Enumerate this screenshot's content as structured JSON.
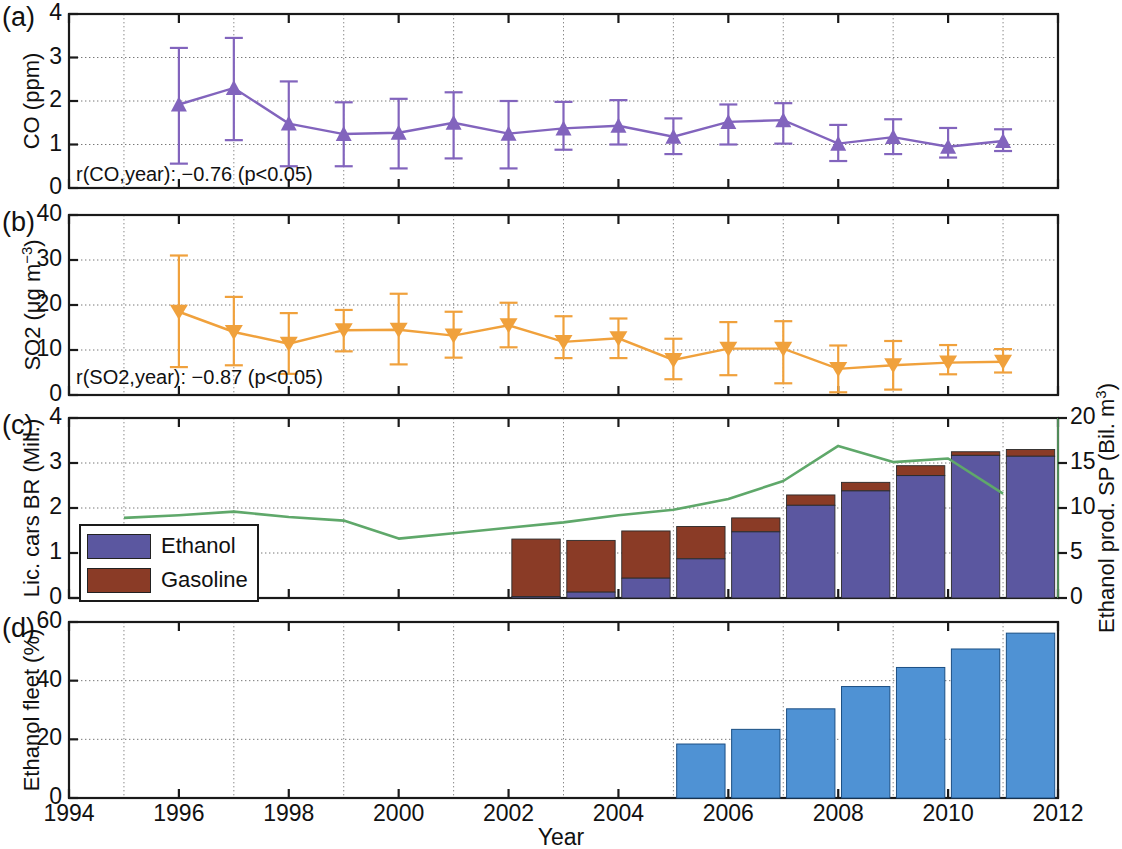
{
  "figure": {
    "xlabel": "Year",
    "x_ticks": [
      "1994",
      "1996",
      "1998",
      "2000",
      "2002",
      "2004",
      "2006",
      "2008",
      "2010",
      "2012"
    ],
    "xlim": [
      1994,
      2012
    ],
    "panels": [
      "(a)",
      "(b)",
      "(c)",
      "(d)"
    ]
  },
  "panel_a": {
    "letter": "(a)",
    "ylabel": "CO (ppm)",
    "y_ticks": [
      "0",
      "1",
      "2",
      "3",
      "4"
    ],
    "annotation": "r(CO,year): −0.76 (p<0.05)",
    "color": "#8264bd"
  },
  "panel_b": {
    "letter": "(b)",
    "ylabel_main": "SO2 (μg m",
    "ylabel_sup": "−3",
    "ylabel_tail": ")",
    "y_ticks": [
      "0",
      "10",
      "20",
      "30",
      "40"
    ],
    "annotation": "r(SO2,year): −0.87 (p<0.05)",
    "color": "#f0a13c"
  },
  "panel_c": {
    "letter": "(c)",
    "ylabel": "Lic. cars BR (Mill.)",
    "y_ticks": [
      "0",
      "1",
      "2",
      "3",
      "4"
    ],
    "ylabel_right_main": "Ethanol prod. SP (Bil. m",
    "ylabel_right_sup": "3",
    "ylabel_right_tail": ")",
    "y_ticks_right": [
      "0",
      "5",
      "10",
      "15",
      "20"
    ],
    "legend": [
      {
        "label": "Ethanol",
        "color": "#5b57a0"
      },
      {
        "label": "Gasoline",
        "color": "#8a3b26"
      }
    ],
    "line_color": "#5fa86a"
  },
  "panel_d": {
    "letter": "(d)",
    "ylabel": "Ethanol fleet (%)",
    "y_ticks": [
      "0",
      "20",
      "40",
      "60"
    ],
    "color": "#4f92d4"
  },
  "chart_data": [
    {
      "type": "line",
      "panel": "(a)",
      "title": "",
      "ylabel": "CO (ppm)",
      "xlabel": "Year",
      "ylim": [
        0,
        4
      ],
      "xlim": [
        1994,
        2012
      ],
      "grid": true,
      "annotation": "r(CO,year): −0.76 (p<0.05)",
      "marker": "triangle-up",
      "color": "#8264bd",
      "x": [
        1996,
        1997,
        1998,
        1999,
        2000,
        2001,
        2002,
        2003,
        2004,
        2005,
        2006,
        2007,
        2008,
        2009,
        2010,
        2011
      ],
      "values": [
        1.92,
        2.3,
        1.48,
        1.24,
        1.27,
        1.37,
        1.5,
        1.25,
        1.37,
        1.43,
        1.18,
        1.52,
        1.56,
        1.02,
        1.17,
        1.16,
        0.95,
        1.08
      ],
      "series": [
        {
          "name": "CO",
          "x": [
            1996,
            1997,
            1998,
            1999,
            2000,
            2001,
            2002,
            2003,
            2004,
            2005,
            2006,
            2007,
            2008,
            2009,
            2010,
            2011
          ],
          "values": [
            1.92,
            2.3,
            1.48,
            1.24,
            1.27,
            1.5,
            1.25,
            1.37,
            1.43,
            1.18,
            1.52,
            1.56,
            1.02,
            1.17,
            0.95,
            1.08
          ],
          "err_low": [
            0.56,
            1.1,
            0.5,
            0.5,
            0.45,
            0.68,
            0.45,
            0.88,
            1.0,
            0.78,
            1.0,
            1.02,
            0.62,
            0.78,
            0.7,
            0.85
          ],
          "err_high": [
            3.22,
            3.45,
            2.45,
            1.97,
            2.05,
            2.2,
            2.0,
            1.98,
            2.02,
            1.6,
            1.92,
            1.95,
            1.45,
            1.58,
            1.38,
            1.35
          ]
        }
      ]
    },
    {
      "type": "line",
      "panel": "(b)",
      "title": "",
      "ylabel": "SO2 (μg m−3)",
      "xlabel": "Year",
      "ylim": [
        0,
        40
      ],
      "xlim": [
        1994,
        2012
      ],
      "grid": true,
      "annotation": "r(SO2,year): −0.87 (p<0.05)",
      "marker": "triangle-down",
      "color": "#f0a13c",
      "series": [
        {
          "name": "SO2",
          "x": [
            1996,
            1997,
            1998,
            1999,
            2000,
            2001,
            2002,
            2003,
            2004,
            2005,
            2006,
            2007,
            2008,
            2009,
            2010,
            2011
          ],
          "values": [
            18.5,
            14.0,
            11.4,
            14.4,
            14.5,
            13.2,
            15.5,
            11.8,
            12.6,
            7.8,
            10.3,
            10.3,
            5.8,
            6.6,
            7.2,
            7.4
          ],
          "err_low": [
            6.2,
            6.6,
            4.7,
            9.7,
            6.8,
            8.3,
            10.6,
            8.2,
            8.2,
            3.5,
            4.4,
            2.6,
            0.6,
            1.2,
            4.6,
            5.0
          ],
          "err_high": [
            31.0,
            21.8,
            18.2,
            18.9,
            22.5,
            18.5,
            20.5,
            17.5,
            17.0,
            12.5,
            16.2,
            16.4,
            11.0,
            12.0,
            11.1,
            10.2
          ]
        }
      ]
    },
    {
      "type": "bar",
      "panel": "(c)",
      "title": "",
      "ylabel": "Lic. cars BR (Mill.)",
      "ylabel_right": "Ethanol prod. SP (Bil. m3)",
      "xlabel": "Year",
      "ylim": [
        0,
        4
      ],
      "ylim_right": [
        0,
        20
      ],
      "xlim": [
        1994,
        2012
      ],
      "grid": true,
      "stacked": true,
      "categories": [
        2002,
        2003,
        2004,
        2005,
        2006,
        2007,
        2008,
        2009,
        2010,
        2011
      ],
      "series": [
        {
          "name": "Ethanol",
          "color": "#5b57a0",
          "values": [
            0.03,
            0.13,
            0.44,
            0.87,
            1.47,
            2.06,
            2.38,
            2.72,
            3.17,
            3.15
          ]
        },
        {
          "name": "Gasoline",
          "color": "#8a3b26",
          "values": [
            1.28,
            1.15,
            1.05,
            0.72,
            0.31,
            0.23,
            0.19,
            0.22,
            0.08,
            0.15
          ]
        }
      ],
      "line_series": {
        "name": "Ethanol prod. SP",
        "color": "#5fa86a",
        "axis": "right",
        "x": [
          1995,
          1996,
          1997,
          1998,
          1999,
          2000,
          2001,
          2002,
          2003,
          2004,
          2005,
          2006,
          2007,
          2008,
          2009,
          2010,
          2011
        ],
        "values": [
          8.9,
          9.2,
          9.6,
          9.0,
          8.6,
          6.6,
          7.2,
          7.8,
          8.4,
          9.2,
          9.8,
          11.0,
          13.0,
          16.9,
          15.1,
          15.5,
          11.6
        ]
      }
    },
    {
      "type": "bar",
      "panel": "(d)",
      "title": "",
      "ylabel": "Ethanol fleet (%)",
      "xlabel": "Year",
      "ylim": [
        0,
        60
      ],
      "xlim": [
        1994,
        2012
      ],
      "grid": true,
      "color": "#4f92d4",
      "categories": [
        2005,
        2006,
        2007,
        2008,
        2009,
        2010,
        2011
      ],
      "values": [
        18.4,
        23.4,
        30.4,
        38.0,
        44.5,
        50.8,
        56.2
      ]
    }
  ]
}
